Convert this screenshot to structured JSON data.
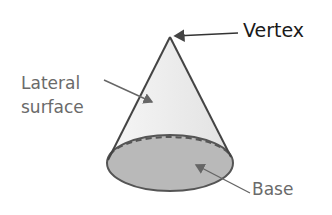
{
  "labels": {
    "vertex": "Vertex",
    "lateral_surface": "Lateral\nsurface",
    "base": "Base"
  },
  "colors": {
    "outline": "#555555",
    "lateral_fill": "#ececec",
    "base_fill": "#b8b8b8",
    "arrow": "#555555"
  }
}
